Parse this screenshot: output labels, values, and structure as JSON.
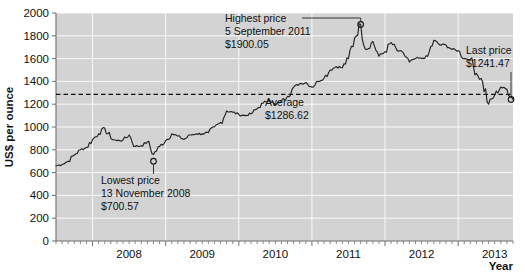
{
  "chart_data": {
    "type": "line",
    "title": "",
    "xlabel": "Year",
    "ylabel": "US$ per ounce",
    "ylim": [
      0,
      2000
    ],
    "ytick_step": 200,
    "yticks": [
      "0",
      "200",
      "400",
      "600",
      "800",
      "1000",
      "1200",
      "1400",
      "1600",
      "1800",
      "2000"
    ],
    "xlim": [
      "2007-07",
      "2013-10"
    ],
    "xticks": [
      "2008",
      "2009",
      "2010",
      "2011",
      "2012",
      "2013"
    ],
    "grid": true,
    "legend": "none",
    "minor_ticks": "monthly",
    "plot_bg": "#d3d3d3",
    "series": [
      {
        "name": "Gold price",
        "color": "#222222",
        "x": [
          "2007-07",
          "2007-08",
          "2007-09",
          "2007-10",
          "2007-11",
          "2007-12",
          "2008-01",
          "2008-02",
          "2008-03",
          "2008-04",
          "2008-05",
          "2008-06",
          "2008-07",
          "2008-08",
          "2008-09",
          "2008-10",
          "2008-11",
          "2008-12",
          "2009-01",
          "2009-02",
          "2009-03",
          "2009-04",
          "2009-05",
          "2009-06",
          "2009-07",
          "2009-08",
          "2009-09",
          "2009-10",
          "2009-11",
          "2009-12",
          "2010-01",
          "2010-02",
          "2010-03",
          "2010-04",
          "2010-05",
          "2010-06",
          "2010-07",
          "2010-08",
          "2010-09",
          "2010-10",
          "2010-11",
          "2010-12",
          "2011-01",
          "2011-02",
          "2011-03",
          "2011-04",
          "2011-05",
          "2011-06",
          "2011-07",
          "2011-08",
          "2011-09",
          "2011-10",
          "2011-11",
          "2011-12",
          "2012-01",
          "2012-02",
          "2012-03",
          "2012-04",
          "2012-05",
          "2012-06",
          "2012-07",
          "2012-08",
          "2012-09",
          "2012-10",
          "2012-11",
          "2012-12",
          "2013-01",
          "2013-02",
          "2013-03",
          "2013-04",
          "2013-05",
          "2013-06",
          "2013-07",
          "2013-08",
          "2013-09",
          "2013-10"
        ],
        "values": [
          660,
          672,
          700,
          755,
          800,
          820,
          890,
          940,
          990,
          900,
          880,
          885,
          930,
          830,
          835,
          870,
          760,
          830,
          880,
          940,
          920,
          890,
          930,
          940,
          940,
          950,
          1000,
          1040,
          1140,
          1130,
          1110,
          1100,
          1115,
          1160,
          1210,
          1240,
          1190,
          1230,
          1270,
          1350,
          1380,
          1390,
          1350,
          1400,
          1430,
          1500,
          1530,
          1520,
          1600,
          1780,
          1900,
          1680,
          1750,
          1620,
          1660,
          1740,
          1670,
          1650,
          1570,
          1600,
          1600,
          1620,
          1760,
          1720,
          1720,
          1680,
          1670,
          1600,
          1595,
          1470,
          1400,
          1200,
          1280,
          1350,
          1330,
          1241
        ]
      }
    ],
    "reference_lines": [
      {
        "name": "average",
        "value": 1286.62,
        "style": "dashed",
        "label": "Average",
        "value_label": "$1286.62"
      }
    ],
    "annotations": [
      {
        "name": "highest-price",
        "line1": "Highest price",
        "line2": "5 September 2011",
        "line3": "$1900.05",
        "point_date": "2011-09-05",
        "point_value": 1900.05
      },
      {
        "name": "lowest-price",
        "line1": "Lowest price",
        "line2": "13 November 2008",
        "line3": "$700.57",
        "point_date": "2008-11-13",
        "point_value": 700.57
      },
      {
        "name": "average-label",
        "line1": "Average",
        "line2": "$1286.62",
        "point_value": 1286.62
      },
      {
        "name": "last-price",
        "line1": "Last price",
        "line2": "$1241.47",
        "point_date": "2013-10-01",
        "point_value": 1241.47
      }
    ]
  }
}
